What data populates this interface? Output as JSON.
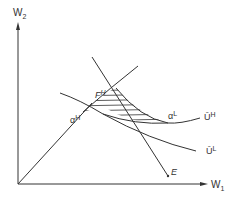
{
  "diagram": {
    "axes": {
      "y_label": "W",
      "y_sub": "2",
      "x_label": "W",
      "x_sub": "1"
    },
    "points": {
      "alpha_H": {
        "base": "α",
        "sup": "H"
      },
      "alpha_L": {
        "base": "α",
        "sup": "L"
      },
      "F_H": {
        "base": "F",
        "sup": "H"
      },
      "E": {
        "base": "E"
      }
    },
    "curves": {
      "U_H": {
        "base": "Ū",
        "sup": "H"
      },
      "U_L": {
        "base": "Ū",
        "sup": "L"
      }
    },
    "colors": {
      "line": "#333333",
      "hatch": "#333333",
      "background": "#ffffff"
    }
  }
}
